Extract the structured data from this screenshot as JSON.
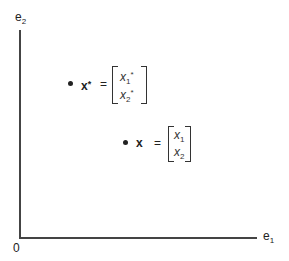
{
  "axes": {
    "vertical_label": "e",
    "vertical_label_sub": "2",
    "horizontal_label": "e",
    "horizontal_label_sub": "1",
    "origin_label": "0"
  },
  "points": [
    {
      "name": "x-star",
      "symbol": "x",
      "symbol_sup": "*",
      "equals": "=",
      "components": [
        {
          "var": "x",
          "sub": "1",
          "sup": "*"
        },
        {
          "var": "x",
          "sub": "2",
          "sup": "*"
        }
      ]
    },
    {
      "name": "x",
      "symbol": "x",
      "symbol_sup": "",
      "equals": "=",
      "components": [
        {
          "var": "x",
          "sub": "1",
          "sup": ""
        },
        {
          "var": "x",
          "sub": "2",
          "sup": ""
        }
      ]
    }
  ]
}
